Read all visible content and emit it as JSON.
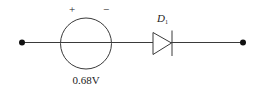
{
  "diagram": {
    "type": "circuit",
    "title": "",
    "components": [
      {
        "id": "V1",
        "kind": "voltage-source",
        "label": "0.68V",
        "polarity": {
          "plus": "+",
          "minus": "−"
        }
      },
      {
        "id": "D1",
        "kind": "diode",
        "label_main": "D",
        "label_sub": "1"
      }
    ],
    "terminals": [
      {
        "id": "left-terminal"
      },
      {
        "id": "right-terminal"
      }
    ],
    "connections": [
      [
        "left-terminal",
        "V1+"
      ],
      [
        "V1-",
        "D1-anode"
      ],
      [
        "D1-cathode",
        "right-terminal"
      ]
    ],
    "colors": {
      "line": "#3a3a3a",
      "dot": "#111111",
      "background": "#ffffff"
    }
  }
}
